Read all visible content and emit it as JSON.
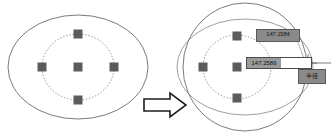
{
  "scene": {
    "title": "Ellipse resize interaction",
    "background_color": "#ffffff",
    "stroke_color": "#555555",
    "node_color": "#5a5a5a",
    "accent_color": "#8a8a8a"
  },
  "left_figure": {
    "name": "original-shape",
    "outer_shape": "ellipse",
    "outer_cx": 78,
    "outer_cy": 67,
    "outer_rx": 70,
    "outer_ry": 52,
    "inner_shape": "dotted-circle",
    "inner_cx": 78,
    "inner_cy": 67,
    "inner_rx": 36,
    "inner_ry": 33,
    "nodes": [
      {
        "name": "node-center",
        "x": 78,
        "y": 67
      },
      {
        "name": "node-top",
        "x": 78,
        "y": 34
      },
      {
        "name": "node-bottom",
        "x": 78,
        "y": 100
      },
      {
        "name": "node-left",
        "x": 42,
        "y": 67
      },
      {
        "name": "node-right",
        "x": 114,
        "y": 67
      }
    ]
  },
  "arrow": {
    "name": "transform-arrow",
    "direction": "right",
    "x": 144,
    "y": 96,
    "width": 42,
    "height": 18
  },
  "right_figure": {
    "name": "resized-shape",
    "ghost_shape": "original-ellipse",
    "ghost_cx": 245,
    "ghost_cy": 67,
    "ghost_rx": 68,
    "ghost_ry": 48,
    "new_shape": "circle",
    "new_cx": 245,
    "new_cy": 67,
    "new_rx": 62,
    "new_ry": 64,
    "inner_shape": "dotted-circle",
    "inner_cx": 237,
    "inner_cy": 67,
    "inner_rx": 34,
    "inner_ry": 32,
    "nodes": [
      {
        "name": "node-center",
        "x": 237,
        "y": 67
      },
      {
        "name": "node-top",
        "x": 237,
        "y": 36
      },
      {
        "name": "node-bottom",
        "x": 237,
        "y": 98
      },
      {
        "name": "node-left",
        "x": 203,
        "y": 67
      }
    ],
    "handle": {
      "name": "drag-handle",
      "x": 308,
      "y": 63,
      "radius": 4
    },
    "leader_line": {
      "x1": 312,
      "y1": 63,
      "x2": 331,
      "y2": 63
    }
  },
  "labels": {
    "dimension_upper": "147.1584",
    "dimension_input_value": "147.2586",
    "unit_badge": "半径"
  }
}
